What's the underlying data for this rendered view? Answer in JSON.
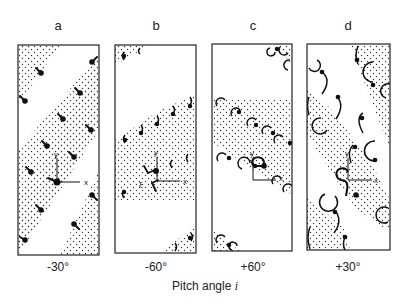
{
  "figure": {
    "panels": [
      {
        "id": "a",
        "letter": "a",
        "angle": "-30°"
      },
      {
        "id": "b",
        "letter": "b",
        "angle": "-60°"
      },
      {
        "id": "c",
        "letter": "c",
        "angle": "+60°"
      },
      {
        "id": "d",
        "letter": "d",
        "angle": "+30°"
      }
    ],
    "axis_labels": {
      "x": "x",
      "y": "y",
      "xi": "ξ"
    },
    "caption_prefix": "Pitch angle ",
    "caption_var": "i"
  }
}
